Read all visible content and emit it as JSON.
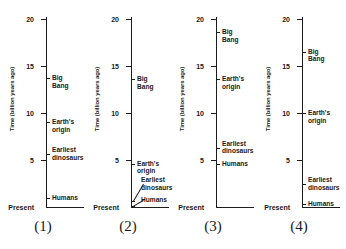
{
  "figure": {
    "axis_title": "Time (billion years ago)",
    "origin_label": "Present",
    "tick_labels": [
      "20",
      "15",
      "10",
      "5"
    ],
    "tick_values": [
      20,
      15,
      10,
      5
    ]
  },
  "chart_data": {
    "type": "scatter",
    "xlabel": "",
    "ylabel": "Time (billion years ago)",
    "ylim": [
      0,
      20
    ],
    "yticks": [
      5,
      10,
      15,
      20
    ],
    "ytick_labels": [
      "5",
      "10",
      "15",
      "20"
    ],
    "grid": false,
    "legend": false,
    "origin_label": "Present",
    "panels": [
      {
        "caption": "(1)",
        "events": [
          {
            "label": "Big Bang",
            "value": 13.7,
            "lines": 1
          },
          {
            "label": "Earth's origin",
            "value": 9.0,
            "lines": 1
          },
          {
            "label": "Earliest\ndinosaurs",
            "value": 5.6,
            "lines": 2
          },
          {
            "label": "Humans",
            "value": 1.0,
            "lines": 1
          }
        ]
      },
      {
        "caption": "(2)",
        "events": [
          {
            "label": "Big Bang",
            "value": 13.6,
            "lines": 1
          },
          {
            "label": "Earth's origin",
            "value": 4.6,
            "lines": 1
          },
          {
            "label": "Earliest\ndinosaurs",
            "value": 0.6,
            "lines": 2
          },
          {
            "label": "Humans",
            "value": 0.1,
            "lines": 1
          }
        ]
      },
      {
        "caption": "(3)",
        "events": [
          {
            "label": "Big Bang",
            "value": 18.6,
            "lines": 1
          },
          {
            "label": "Earth's origin",
            "value": 13.6,
            "lines": 1
          },
          {
            "label": "Earliest\ndinosaurs",
            "value": 6.3,
            "lines": 2
          },
          {
            "label": "Humans",
            "value": 4.6,
            "lines": 1
          }
        ]
      },
      {
        "caption": "(4)",
        "events": [
          {
            "label": "Big Bang",
            "value": 16.5,
            "lines": 1
          },
          {
            "label": "Earth's origin",
            "value": 10.0,
            "lines": 1
          },
          {
            "label": "Earliest\ndinosaurs",
            "value": 2.4,
            "lines": 2
          },
          {
            "label": "Humans",
            "value": 0.3,
            "lines": 1
          }
        ]
      }
    ]
  }
}
